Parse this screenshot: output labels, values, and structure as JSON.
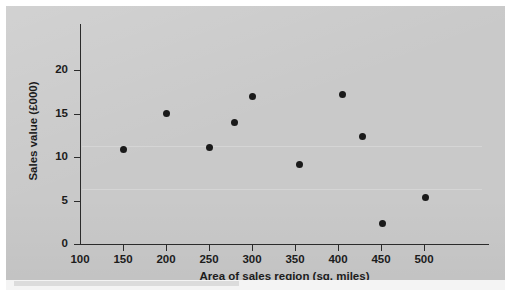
{
  "chart_data": {
    "type": "scatter",
    "title": "",
    "xlabel": "Area of sales region (sq. miles)",
    "ylabel": "Sales value (£000)",
    "xlim": [
      100,
      520
    ],
    "ylim": [
      0,
      22
    ],
    "xticks": [
      100,
      150,
      200,
      250,
      300,
      350,
      400,
      450,
      500
    ],
    "xtick_labels": [
      "100",
      "150",
      "200",
      "250",
      "300",
      "350",
      "400",
      "450",
      "500"
    ],
    "yticks": [
      0,
      5,
      10,
      15,
      20
    ],
    "ytick_labels": [
      "0",
      "5",
      "10",
      "15",
      "20"
    ],
    "grid": false,
    "legend": false,
    "series": [
      {
        "name": "Sales regions",
        "marker": "filled-circle",
        "color": "#1a1a1a",
        "points": [
          {
            "x": 150,
            "y": 10.9
          },
          {
            "x": 200,
            "y": 15.0
          },
          {
            "x": 250,
            "y": 11.1
          },
          {
            "x": 280,
            "y": 14.0
          },
          {
            "x": 300,
            "y": 17.0
          },
          {
            "x": 355,
            "y": 9.1
          },
          {
            "x": 405,
            "y": 17.2
          },
          {
            "x": 428,
            "y": 12.3
          },
          {
            "x": 452,
            "y": 2.3
          },
          {
            "x": 502,
            "y": 5.4
          }
        ]
      }
    ]
  },
  "figure": {
    "background_color": "#c9c9c9",
    "axis_color": "#2b2b2b",
    "text_color": "#1c1c1c"
  }
}
